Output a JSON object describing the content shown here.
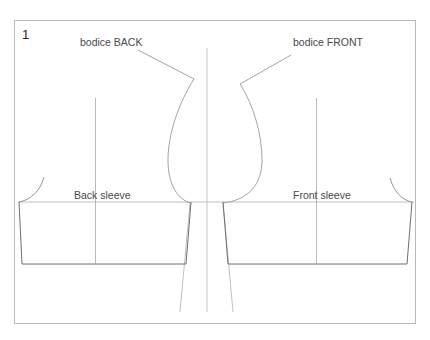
{
  "figure": {
    "number": "1",
    "labels": {
      "bodice_back": "bodice BACK",
      "bodice_front": "bodice FRONT",
      "back_sleeve": "Back sleeve",
      "front_sleeve": "Front sleeve"
    },
    "colors": {
      "frame": "#b8b8b8",
      "outline": "#8a8a8a",
      "guide": "#c4c4c4",
      "text": "#4a4a4a"
    }
  }
}
